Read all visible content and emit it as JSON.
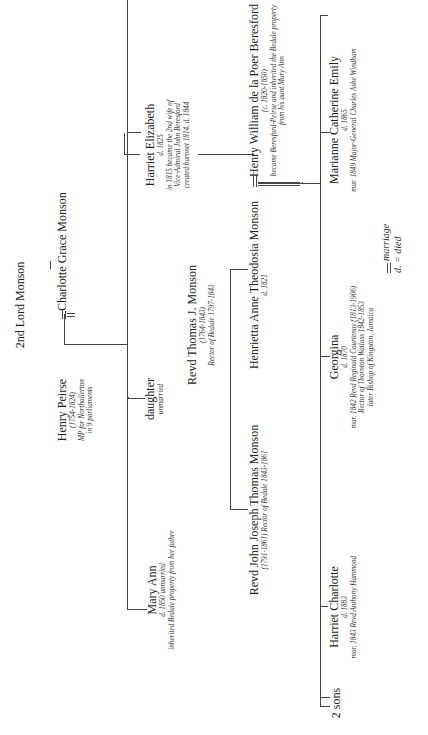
{
  "people": {
    "lord_monson": {
      "name": "2nd Lord Monson"
    },
    "charlotte": {
      "name": "Charlotte Grace Monson"
    },
    "henry_peirse": {
      "name": "Henry Peirse",
      "notes": [
        "(1754-1824)",
        "MP for Northallerton",
        "in 9 parliaments"
      ]
    },
    "daughter": {
      "name": "daughter",
      "notes": [
        "unmarried"
      ]
    },
    "harriet_elizabeth": {
      "name": "Harriet Elizabeth",
      "notes": [
        "d. 1825",
        "in 1815 became the 2nd wife of",
        "Vice-Admiral John Beresford",
        "created baronet 1814, d. 1844"
      ]
    },
    "mary_ann": {
      "name": "Mary Ann",
      "notes": [
        "d. 1850 unmarried",
        "inherited Bedale property from her father"
      ]
    },
    "revd_thomas": {
      "name": "Revd Thomas J. Monson",
      "notes": [
        "(1764-1843)",
        "Rector of Bedale 1797-1843"
      ]
    },
    "revd_john": {
      "name": "Revd John Joseph Thomas Monson",
      "notes": [
        "(1791-1861) Rector of Bedale 1843-1861"
      ]
    },
    "henrietta": {
      "name": "Henrietta Anne Theodosia Monson",
      "notes": [
        "d. 1821"
      ]
    },
    "henry_william": {
      "name": "Henry William de la Poer Beresford",
      "notes": [
        "(c. 1820-1850)",
        "became Beresford-Peirse and inherited the Bedale property",
        "from his aunt Mary Ann"
      ]
    },
    "marianne": {
      "name": "Marianne Catherine Emily",
      "notes": [
        "d. 1865",
        "mar. 1849 Major-General Charles Ashe Windham"
      ]
    },
    "georgina": {
      "name": "Georgina",
      "notes": [
        "d. 1870",
        "mar. 1842 Revd Reginald Courtenay (1813-1906)",
        "Rector of Thornton Watlass 1842-1853",
        "later Bishop of Kingston, Jamaica"
      ]
    },
    "harriet_charlotte": {
      "name": "Harriet Charlotte",
      "notes": [
        "d. 1883",
        "mar. 1843 Revd Anthony Hammond"
      ]
    },
    "two_sons": {
      "name": "2 sons"
    }
  },
  "legend": {
    "marriage": "marriage",
    "died": "d. = died"
  }
}
